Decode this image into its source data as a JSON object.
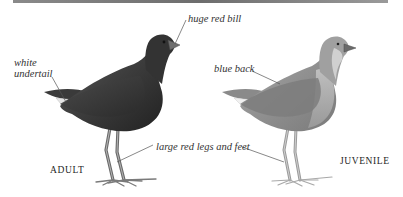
{
  "figure": {
    "colors": {
      "rule": "#7a7a7a",
      "adult_body": "#3a3a3a",
      "juvenile_body": "#8c8c8c",
      "leader_line": "#555555",
      "label_text": "#333333"
    }
  },
  "annotations": {
    "huge_bill": "huge red bill",
    "white_undertail_line1": "white",
    "white_undertail_line2": "undertail",
    "blue_back": "blue back",
    "legs_and_feet": "large red legs and feet"
  },
  "captions": {
    "adult": "ADULT",
    "juvenile": "JUVENILE"
  }
}
